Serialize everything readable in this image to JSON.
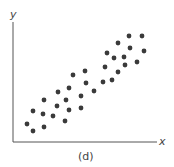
{
  "chart_data": {
    "type": "scatter",
    "title": "",
    "xlabel": "x",
    "ylabel": "y",
    "caption": "(d)",
    "grid": false,
    "legend": null,
    "axis_style": "open L-shaped axes, no ticks",
    "marker_color": "#3a3a3a",
    "axis_color": "#555555",
    "note": "Positive linear correlation; coordinates are pixel positions in the 174x167 image (origin at top-left).",
    "points": [
      {
        "x": 27,
        "y": 124
      },
      {
        "x": 33,
        "y": 131
      },
      {
        "x": 33,
        "y": 111
      },
      {
        "x": 44,
        "y": 127
      },
      {
        "x": 43,
        "y": 114
      },
      {
        "x": 44,
        "y": 100
      },
      {
        "x": 53,
        "y": 116
      },
      {
        "x": 57,
        "y": 106
      },
      {
        "x": 58,
        "y": 92
      },
      {
        "x": 65,
        "y": 121
      },
      {
        "x": 66,
        "y": 100
      },
      {
        "x": 69,
        "y": 110
      },
      {
        "x": 69,
        "y": 88
      },
      {
        "x": 73,
        "y": 75
      },
      {
        "x": 81,
        "y": 108
      },
      {
        "x": 81,
        "y": 96
      },
      {
        "x": 86,
        "y": 83
      },
      {
        "x": 85,
        "y": 71
      },
      {
        "x": 94,
        "y": 91
      },
      {
        "x": 103,
        "y": 82
      },
      {
        "x": 105,
        "y": 67
      },
      {
        "x": 107,
        "y": 53
      },
      {
        "x": 112,
        "y": 80
      },
      {
        "x": 114,
        "y": 58
      },
      {
        "x": 118,
        "y": 72
      },
      {
        "x": 118,
        "y": 43
      },
      {
        "x": 124,
        "y": 57
      },
      {
        "x": 125,
        "y": 65
      },
      {
        "x": 129,
        "y": 36
      },
      {
        "x": 130,
        "y": 48
      },
      {
        "x": 137,
        "y": 62
      },
      {
        "x": 142,
        "y": 36
      },
      {
        "x": 144,
        "y": 51
      }
    ]
  }
}
